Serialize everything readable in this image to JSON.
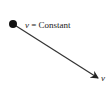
{
  "diagram": {
    "particle_label_var": "v",
    "particle_label_eq": " = Constant",
    "arrow_label": "v",
    "colors": {
      "ink": "#222222",
      "background": "#ffffff"
    }
  }
}
